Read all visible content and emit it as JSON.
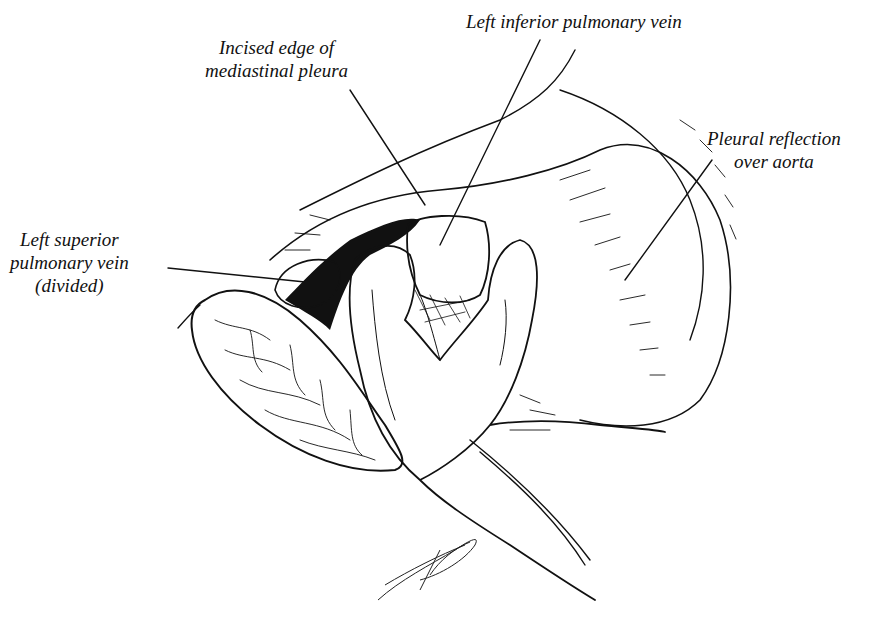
{
  "figure": {
    "type": "surgical anatomical illustration",
    "labels": {
      "incised_edge": [
        "Incised edge of",
        "mediastinal pleura"
      ],
      "left_inferior_pulmonary_vein": [
        "Left inferior pulmonary vein"
      ],
      "pleural_reflection": [
        "Pleural reflection",
        "over aorta"
      ],
      "left_superior_pulmonary_vein": [
        "Left superior",
        "pulmonary vein",
        "(divided)"
      ]
    },
    "signature": "Steven Jacobs MD"
  }
}
